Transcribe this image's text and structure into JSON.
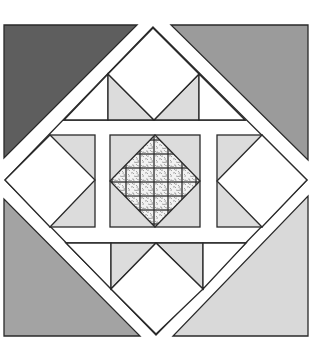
{
  "figure": {
    "type": "quilt-block-diagram"
  },
  "colors": {
    "background": "#ffffff",
    "outline": "#2a2a2a",
    "corner_top_left": "#5e5e5e",
    "corner_top_right": "#9b9b9b",
    "corner_bottom_left": "#a3a3a3",
    "corner_bottom_right": "#d9d9d9",
    "light_triangle": "#dcdcdc",
    "white_patch": "#ffffff",
    "medallion_base": "#f2f2f2",
    "medallion_speckle": "#9a9a9a"
  },
  "pieces": {
    "corners": [
      {
        "name": "corner-triangle-top-left",
        "fill": "corner_top_left"
      },
      {
        "name": "corner-triangle-top-right",
        "fill": "corner_top_right"
      },
      {
        "name": "corner-triangle-bottom-left",
        "fill": "corner_bottom_left"
      },
      {
        "name": "corner-triangle-bottom-right",
        "fill": "corner_bottom_right"
      }
    ],
    "center_medallion": {
      "texture": "speckled"
    }
  }
}
